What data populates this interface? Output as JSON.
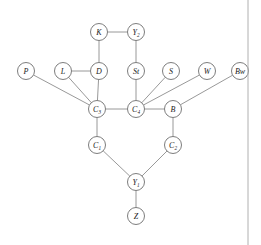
{
  "figure": {
    "kind": "node-link-graph",
    "background_color": "#ffffff",
    "edge_color": "#8d8d8d",
    "node_fill": "#ffffff",
    "node_stroke": "#6e6e6e",
    "label_color": "#1a1a1a",
    "border_color": "#b0b0b0"
  },
  "nodes": [
    {
      "id": "K",
      "base": "K",
      "sub": "",
      "cx": 99,
      "cy": 32,
      "r": 8.5
    },
    {
      "id": "Y2",
      "base": "Y",
      "sub": "2",
      "cx": 136,
      "cy": 32,
      "r": 8.5
    },
    {
      "id": "P",
      "base": "P",
      "sub": "",
      "cx": 26,
      "cy": 71,
      "r": 8.5
    },
    {
      "id": "L",
      "base": "L",
      "sub": "",
      "cx": 63,
      "cy": 71,
      "r": 8.5
    },
    {
      "id": "D",
      "base": "D",
      "sub": "",
      "cx": 99,
      "cy": 71,
      "r": 8.5
    },
    {
      "id": "St",
      "base": "St",
      "sub": "",
      "cx": 136,
      "cy": 71,
      "r": 8.5
    },
    {
      "id": "S",
      "base": "S",
      "sub": "",
      "cx": 171,
      "cy": 71,
      "r": 8.5
    },
    {
      "id": "W",
      "base": "W",
      "sub": "",
      "cx": 207,
      "cy": 71,
      "r": 8.5
    },
    {
      "id": "Bw",
      "base": "Bw",
      "sub": "",
      "cx": 240,
      "cy": 71,
      "r": 8.5
    },
    {
      "id": "C3",
      "base": "C",
      "sub": "3",
      "cx": 97,
      "cy": 109,
      "r": 8.5
    },
    {
      "id": "C4",
      "base": "C",
      "sub": "4",
      "cx": 136,
      "cy": 109,
      "r": 8.5
    },
    {
      "id": "B",
      "base": "B",
      "sub": "",
      "cx": 173,
      "cy": 109,
      "r": 8.5
    },
    {
      "id": "C1",
      "base": "C",
      "sub": "1",
      "cx": 97,
      "cy": 145,
      "r": 8.5
    },
    {
      "id": "C2",
      "base": "C",
      "sub": "2",
      "cx": 173,
      "cy": 145,
      "r": 8.5
    },
    {
      "id": "Y1",
      "base": "Y",
      "sub": "1",
      "cx": 136,
      "cy": 182,
      "r": 8.5
    },
    {
      "id": "Z",
      "base": "Z",
      "sub": "",
      "cx": 136,
      "cy": 216,
      "r": 8.5
    }
  ],
  "edges": [
    {
      "from": "K",
      "to": "Y2"
    },
    {
      "from": "K",
      "to": "D"
    },
    {
      "from": "Y2",
      "to": "St"
    },
    {
      "from": "L",
      "to": "D"
    },
    {
      "from": "P",
      "to": "C3"
    },
    {
      "from": "L",
      "to": "C3"
    },
    {
      "from": "D",
      "to": "C3"
    },
    {
      "from": "St",
      "to": "C4"
    },
    {
      "from": "S",
      "to": "C4"
    },
    {
      "from": "W",
      "to": "C4"
    },
    {
      "from": "Bw",
      "to": "B"
    },
    {
      "from": "C3",
      "to": "C4"
    },
    {
      "from": "C4",
      "to": "B"
    },
    {
      "from": "C3",
      "to": "C1"
    },
    {
      "from": "B",
      "to": "C2"
    },
    {
      "from": "C1",
      "to": "Y1"
    },
    {
      "from": "C2",
      "to": "Y1"
    },
    {
      "from": "Y1",
      "to": "Z"
    }
  ],
  "border": {
    "x": 248,
    "y1": 0,
    "y2": 245
  }
}
